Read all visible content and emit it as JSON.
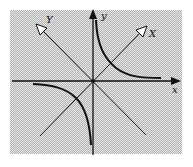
{
  "diagram": {
    "colors": {
      "background": "#ffffff",
      "panel": "#b8b8b8",
      "panel_dots": "#e8e8e8",
      "ink": "#111111",
      "arrow_fill_hollow": "#ffffff"
    },
    "axes": {
      "x_label": "x",
      "y_label": "y",
      "rotated_x_label": "X",
      "rotated_y_label": "Y"
    },
    "curves": [
      {
        "name": "hyperbola-branch-q1",
        "quadrant": "I"
      },
      {
        "name": "hyperbola-branch-q3",
        "quadrant": "III"
      }
    ]
  }
}
